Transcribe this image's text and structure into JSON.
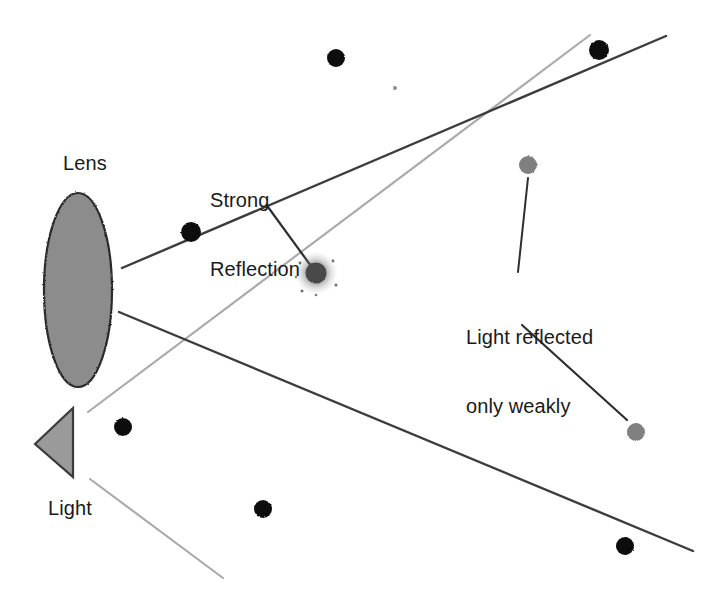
{
  "diagram": {
    "background_color": "#ffffff",
    "width": 727,
    "height": 608,
    "labels": {
      "lens": "Lens",
      "light": "Light",
      "strong_reflection_line1": "Strong",
      "strong_reflection_line2": "Reflection",
      "weak_reflection_line1": "Light reflected",
      "weak_reflection_line2": "only weakly"
    },
    "colors": {
      "lens_fill": "#8c8c8c",
      "lens_stroke": "#2b2b2b",
      "light_fill": "#9a9a9a",
      "light_stroke": "#3a3a3a",
      "dark_particle": "#111111",
      "gray_particle": "#808080",
      "strong_reflection": "#4a4a4a",
      "dark_ray": "#3c3c3c",
      "gray_ray": "#a9a9a9",
      "leader_line": "#2e2e2e",
      "text": "#1a1a1a"
    },
    "shapes": {
      "lens": {
        "cx": 78,
        "cy": 290,
        "rx": 34,
        "ry": 97
      },
      "light_source": {
        "apex_x": 35,
        "apex_y": 444,
        "top_x": 73,
        "top_y": 408,
        "bottom_x": 73,
        "bottom_y": 477
      }
    },
    "rays": [
      {
        "name": "lens-upper-dark-ray",
        "kind": "dark",
        "x1": 122,
        "y1": 268,
        "x2": 666,
        "y2": 36
      },
      {
        "name": "lens-lower-dark-ray",
        "kind": "dark",
        "x1": 119,
        "y1": 312,
        "x2": 693,
        "y2": 551
      },
      {
        "name": "light-upper-gray-ray",
        "kind": "gray",
        "x1": 88,
        "y1": 412,
        "x2": 590,
        "y2": 35
      },
      {
        "name": "light-lower-gray-ray",
        "kind": "gray",
        "x1": 90,
        "y1": 479,
        "x2": 223,
        "y2": 578
      }
    ],
    "leader_lines": [
      {
        "name": "strong-reflection-leader",
        "x1": 268,
        "y1": 207,
        "x2": 311,
        "y2": 266
      },
      {
        "name": "weak-reflection-upper-leader",
        "x1": 528,
        "y1": 178,
        "x2": 518,
        "y2": 272
      },
      {
        "name": "weak-reflection-lower-leader",
        "x1": 522,
        "y1": 325,
        "x2": 627,
        "y2": 420
      }
    ],
    "particles": [
      {
        "name": "particle-top-center",
        "cx": 336,
        "cy": 58,
        "r": 9,
        "tone": "dark"
      },
      {
        "name": "particle-top-right",
        "cx": 599,
        "cy": 50,
        "r": 10,
        "tone": "dark"
      },
      {
        "name": "particle-near-lens",
        "cx": 191,
        "cy": 232,
        "r": 10,
        "tone": "dark"
      },
      {
        "name": "particle-weak-upper",
        "cx": 528,
        "cy": 165,
        "r": 9,
        "tone": "gray"
      },
      {
        "name": "particle-strong-reflection",
        "cx": 316,
        "cy": 273,
        "r": 10,
        "tone": "glow"
      },
      {
        "name": "particle-weak-lower",
        "cx": 636,
        "cy": 432,
        "r": 9,
        "tone": "gray"
      },
      {
        "name": "particle-left-lower",
        "cx": 123,
        "cy": 427,
        "r": 9,
        "tone": "dark"
      },
      {
        "name": "particle-bottom-center",
        "cx": 263,
        "cy": 509,
        "r": 9,
        "tone": "dark"
      },
      {
        "name": "particle-bottom-right",
        "cx": 625,
        "cy": 546,
        "r": 9,
        "tone": "dark"
      },
      {
        "name": "particle-speck",
        "cx": 395,
        "cy": 88,
        "r": 2,
        "tone": "speck"
      }
    ]
  }
}
